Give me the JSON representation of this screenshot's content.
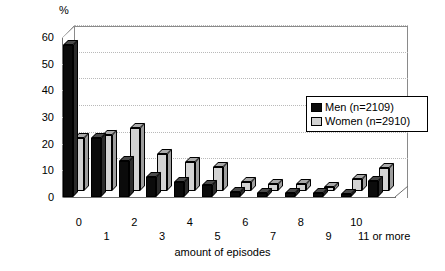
{
  "chart_data": {
    "type": "bar",
    "title": "",
    "ylabel": "%",
    "xlabel": "amount of episodes",
    "ylim": [
      0,
      60
    ],
    "yticks": [
      0,
      10,
      20,
      30,
      40,
      50,
      60
    ],
    "grid": true,
    "legend_position": "inside-right",
    "categories": [
      "0",
      "1",
      "2",
      "3",
      "4",
      "5",
      "6",
      "7",
      "8",
      "9",
      "10",
      "11 or more"
    ],
    "series": [
      {
        "name": "Men (n=2109)",
        "color": "#0b0b0b",
        "values": [
          57,
          22,
          13.5,
          7.5,
          5.5,
          4.5,
          2,
          1.5,
          1.5,
          1.5,
          1,
          6
        ]
      },
      {
        "name": "Women (n=2910)",
        "color": "#d2d2d2",
        "values": [
          20,
          21,
          23.5,
          14,
          11,
          9,
          3.5,
          2.5,
          2.5,
          1.5,
          4.5,
          8.5
        ]
      }
    ]
  },
  "axis": {
    "y_unit_label": "%",
    "y_ticks": [
      "0",
      "10",
      "20",
      "30",
      "40",
      "50",
      "60"
    ],
    "x_ticks": [
      "0",
      "1",
      "2",
      "3",
      "4",
      "5",
      "6",
      "7",
      "8",
      "9",
      "10",
      "11 or more"
    ],
    "x_title": "amount of episodes"
  },
  "legend": {
    "items": [
      {
        "label": "Men (n=2109)"
      },
      {
        "label": "Women (n=2910)"
      }
    ]
  }
}
